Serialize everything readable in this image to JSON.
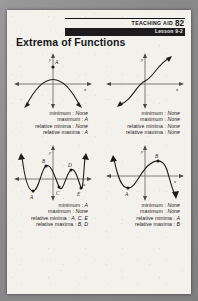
{
  "header": {
    "aid_label": "TEACHING AID",
    "aid_number": "82",
    "lesson": "Lesson 9-2"
  },
  "title": "Extrema of Functions",
  "labels": {
    "y_axis": "y",
    "x_axis": "x",
    "minimum": "minimum :",
    "maximum": "maximum :",
    "relative_minima": "relative minima :",
    "relative_maxima": "relative maxima :"
  },
  "figures": [
    {
      "id": "figure-1",
      "curve": "downward-parabola",
      "points": [
        "A"
      ],
      "results": {
        "minimum": "None",
        "maximum": "A",
        "relative_minima": "None",
        "relative_maxima": "A"
      }
    },
    {
      "id": "figure-2",
      "curve": "increasing-cubic",
      "points": [],
      "results": {
        "minimum": "None",
        "maximum": "None",
        "relative_minima": "None",
        "relative_maxima": "None"
      }
    },
    {
      "id": "figure-3",
      "curve": "wave-three-valleys-two-peaks",
      "points": [
        "A",
        "B",
        "C",
        "D",
        "E"
      ],
      "results": {
        "minimum": "A",
        "maximum": "None",
        "relative_minima": "A, C, E",
        "relative_maxima": "B, D"
      }
    },
    {
      "id": "figure-4",
      "curve": "sine-one-valley-one-peak",
      "points": [
        "A",
        "B"
      ],
      "results": {
        "minimum": "None",
        "maximum": "None",
        "relative_minima": "A",
        "relative_maxima": "B"
      }
    }
  ],
  "colors": {
    "ink": "#1b1b1b",
    "paper": "#f3f1ec",
    "band": "#1c1c1c",
    "backdrop": "#8e8e8e"
  }
}
